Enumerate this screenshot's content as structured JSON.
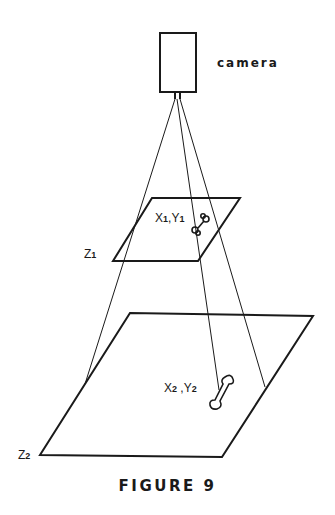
{
  "figure": {
    "caption": "FIGURE 9",
    "camera_label": "camera",
    "plane1": {
      "label": "Z",
      "label_sub": "1",
      "point_label_x": "X",
      "point_label_x_sub": "1",
      "point_label_sep": ",",
      "point_label_y": "Y",
      "point_label_y_sub": "1"
    },
    "plane2": {
      "label": "Z",
      "label_sub": "2",
      "point_label_x": "X",
      "point_label_x_sub": "2",
      "point_label_sep": " ,",
      "point_label_y": "Y",
      "point_label_y_sub": "2"
    }
  },
  "colors": {
    "ink": "#1a1a1a",
    "background": "#ffffff"
  }
}
